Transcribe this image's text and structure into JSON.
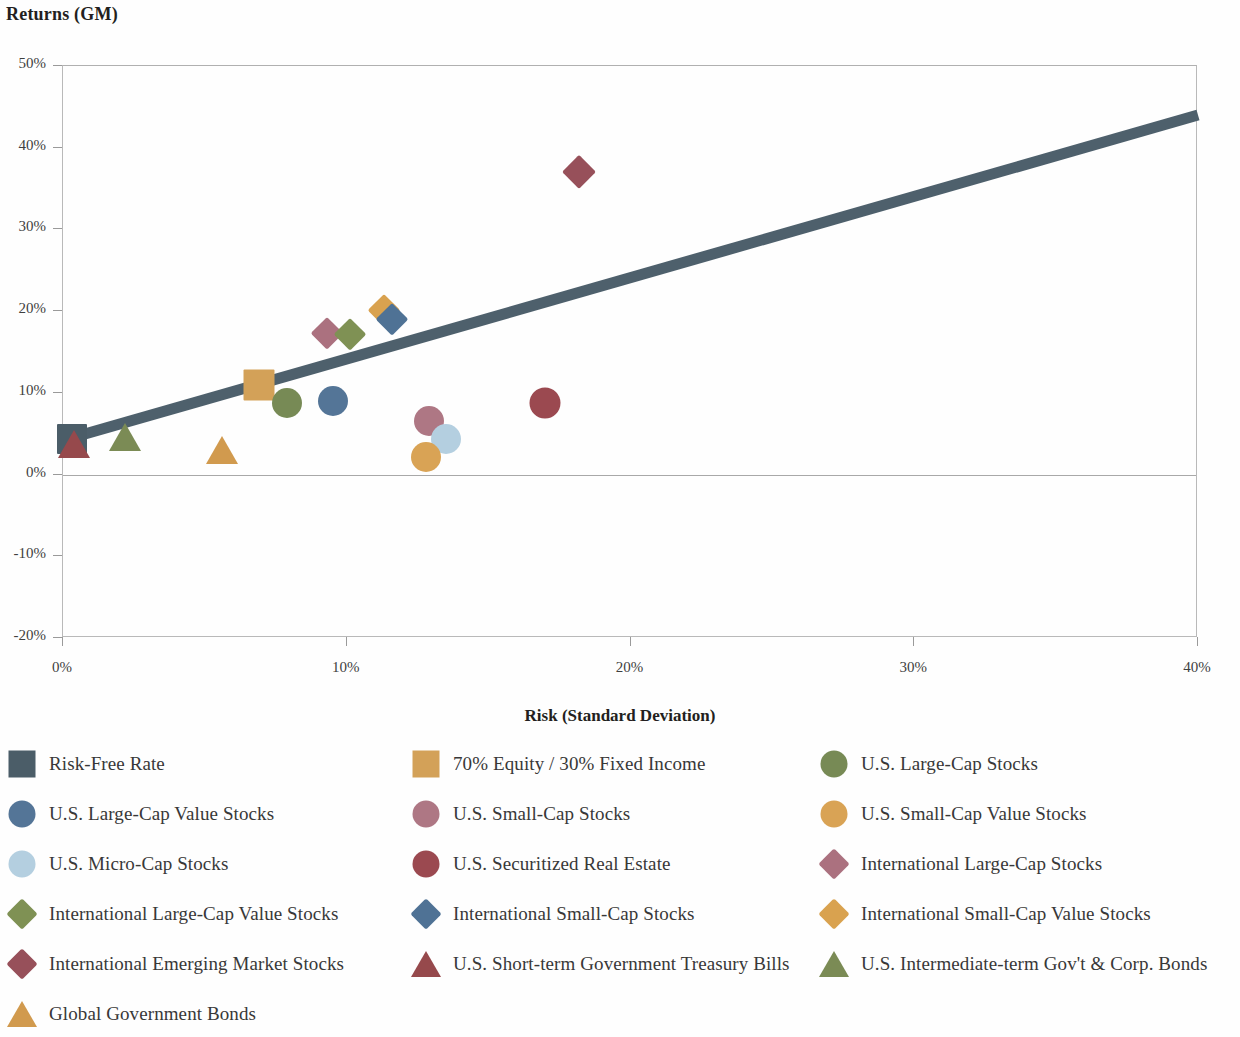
{
  "chart_data": {
    "type": "scatter",
    "title": "Returns (GM)",
    "xlabel": "Risk (Standard Deviation)",
    "ylabel": "Returns (GM)",
    "xlim": [
      0,
      40
    ],
    "ylim": [
      -20,
      50
    ],
    "xtick_labels": [
      "0%",
      "10%",
      "20%",
      "30%",
      "40%"
    ],
    "xticks": [
      0,
      10,
      20,
      30,
      40
    ],
    "ytick_labels": [
      "50%",
      "40%",
      "30%",
      "20%",
      "10%",
      "0%",
      "-10%",
      "-20%"
    ],
    "yticks": [
      50,
      40,
      30,
      20,
      10,
      0,
      -10,
      -20
    ],
    "grid": false,
    "legend_position": "bottom",
    "zero_line": 0,
    "trendline": {
      "name": "capital-market-line",
      "color": "#4e606c",
      "width": 11,
      "x0": 0.0,
      "y0": 4.2,
      "x1": 40.0,
      "y1": 44.0
    },
    "points": [
      {
        "label": "Risk-Free Rate",
        "marker": "square",
        "color": "#4b5d68",
        "x": 0.3,
        "y": 4.3,
        "size": 30
      },
      {
        "label": "U.S. Short-term Government Treasury Bills",
        "marker": "triangle",
        "color": "#96494c",
        "x": 0.4,
        "y": 3.7,
        "size": 32
      },
      {
        "label": "U.S. Intermediate-term Gov't & Corp. Bonds",
        "marker": "triangle",
        "color": "#7b8b55",
        "x": 2.2,
        "y": 4.6,
        "size": 32
      },
      {
        "label": "Global Government Bonds",
        "marker": "triangle",
        "color": "#d19a4e",
        "x": 5.6,
        "y": 3.0,
        "size": 32
      },
      {
        "label": "70% Equity / 30% Fixed Income",
        "marker": "square",
        "color": "#d3a158",
        "x": 6.9,
        "y": 11.0,
        "size": 31
      },
      {
        "label": "U.S. Large-Cap Stocks",
        "marker": "circle",
        "color": "#778a55",
        "x": 7.9,
        "y": 8.7,
        "size": 30
      },
      {
        "label": "U.S. Large-Cap Value Stocks",
        "marker": "circle",
        "color": "#547597",
        "x": 9.5,
        "y": 9.0,
        "size": 30
      },
      {
        "label": "International Large-Cap Stocks",
        "marker": "diamond",
        "color": "#ab717f",
        "x": 9.3,
        "y": 17.3,
        "size": 29
      },
      {
        "label": "International Large-Cap Value Stocks",
        "marker": "diamond",
        "color": "#7f9154",
        "x": 10.1,
        "y": 17.2,
        "size": 29
      },
      {
        "label": "International Small-Cap Value Stocks",
        "marker": "diamond",
        "color": "#d9a24f",
        "x": 11.3,
        "y": 20.1,
        "size": 29
      },
      {
        "label": "International Small-Cap Stocks",
        "marker": "diamond",
        "color": "#4f7295",
        "x": 11.6,
        "y": 19.0,
        "size": 29
      },
      {
        "label": "U.S. Small-Cap Stocks",
        "marker": "circle",
        "color": "#ae7784",
        "x": 12.9,
        "y": 6.5,
        "size": 30
      },
      {
        "label": "U.S. Micro-Cap Stocks",
        "marker": "circle",
        "color": "#b4cfe0",
        "x": 13.5,
        "y": 4.3,
        "size": 30
      },
      {
        "label": "U.S. Small-Cap Value Stocks",
        "marker": "circle",
        "color": "#d9a355",
        "x": 12.8,
        "y": 2.2,
        "size": 30
      },
      {
        "label": "U.S. Securitized Real Estate",
        "marker": "circle",
        "color": "#9b4950",
        "x": 17.0,
        "y": 8.8,
        "size": 31
      },
      {
        "label": "International Emerging Market Stocks",
        "marker": "diamond",
        "color": "#97505a",
        "x": 18.2,
        "y": 37.0,
        "size": 31
      }
    ]
  },
  "legend": {
    "items": [
      {
        "label": "Risk-Free Rate",
        "marker": "square",
        "color": "#4b5d68"
      },
      {
        "label": "70% Equity / 30% Fixed Income",
        "marker": "square",
        "color": "#d3a158"
      },
      {
        "label": "U.S. Large-Cap Stocks",
        "marker": "circle",
        "color": "#778a55"
      },
      {
        "label": "U.S. Large-Cap Value Stocks",
        "marker": "circle",
        "color": "#547597"
      },
      {
        "label": "U.S. Small-Cap Stocks",
        "marker": "circle",
        "color": "#ae7784"
      },
      {
        "label": "U.S. Small-Cap Value Stocks",
        "marker": "circle",
        "color": "#d9a355"
      },
      {
        "label": "U.S. Micro-Cap Stocks",
        "marker": "circle",
        "color": "#b4cfe0"
      },
      {
        "label": "U.S. Securitized Real Estate",
        "marker": "circle",
        "color": "#9b4950"
      },
      {
        "label": "International Large-Cap Stocks",
        "marker": "diamond",
        "color": "#ab717f"
      },
      {
        "label": "International Large-Cap Value Stocks",
        "marker": "diamond",
        "color": "#7f9154"
      },
      {
        "label": "International Small-Cap Stocks",
        "marker": "diamond",
        "color": "#4f7295"
      },
      {
        "label": "International Small-Cap Value Stocks",
        "marker": "diamond",
        "color": "#d9a24f"
      },
      {
        "label": "International Emerging Market Stocks",
        "marker": "diamond",
        "color": "#97505a"
      },
      {
        "label": "U.S. Short-term Government Treasury Bills",
        "marker": "triangle",
        "color": "#96494c"
      },
      {
        "label": "U.S. Intermediate-term Gov't & Corp. Bonds",
        "marker": "triangle",
        "color": "#7b8b55"
      },
      {
        "label": "Global Government Bonds",
        "marker": "triangle",
        "color": "#d19a4e"
      }
    ],
    "columns": 3,
    "rows": 6
  }
}
